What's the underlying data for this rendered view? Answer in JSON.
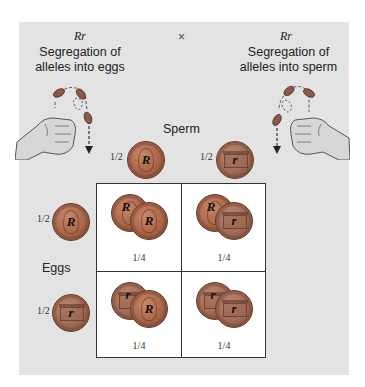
{
  "left_parent": {
    "genotype": "Rr",
    "caption_line1": "Segregation of",
    "caption_line2": "alleles into eggs"
  },
  "cross_symbol": "×",
  "right_parent": {
    "genotype": "Rr",
    "caption_line1": "Segregation of",
    "caption_line2": "alleles into sperm"
  },
  "sperm": {
    "label": "Sperm",
    "gametes": [
      {
        "fraction": "1/2",
        "allele": "R",
        "coin": "heads"
      },
      {
        "fraction": "1/2",
        "allele": "r",
        "coin": "tails"
      }
    ]
  },
  "eggs": {
    "label": "Eggs",
    "gametes": [
      {
        "fraction": "1/2",
        "allele": "R",
        "coin": "heads"
      },
      {
        "fraction": "1/2",
        "allele": "r",
        "coin": "tails"
      }
    ]
  },
  "punnett": {
    "cells": [
      {
        "row": 0,
        "col": 0,
        "alleles": [
          "R",
          "R"
        ],
        "fraction": "1/4"
      },
      {
        "row": 0,
        "col": 1,
        "alleles": [
          "R",
          "r"
        ],
        "fraction": "1/4"
      },
      {
        "row": 1,
        "col": 0,
        "alleles": [
          "r",
          "R"
        ],
        "fraction": "1/4"
      },
      {
        "row": 1,
        "col": 1,
        "alleles": [
          "r",
          "r"
        ],
        "fraction": "1/4"
      }
    ]
  },
  "colors": {
    "panel_bg": "#e3e3e3",
    "grid_bg": "#ffffff",
    "grid_border": "#333333",
    "coin_copper": "#a86548"
  }
}
